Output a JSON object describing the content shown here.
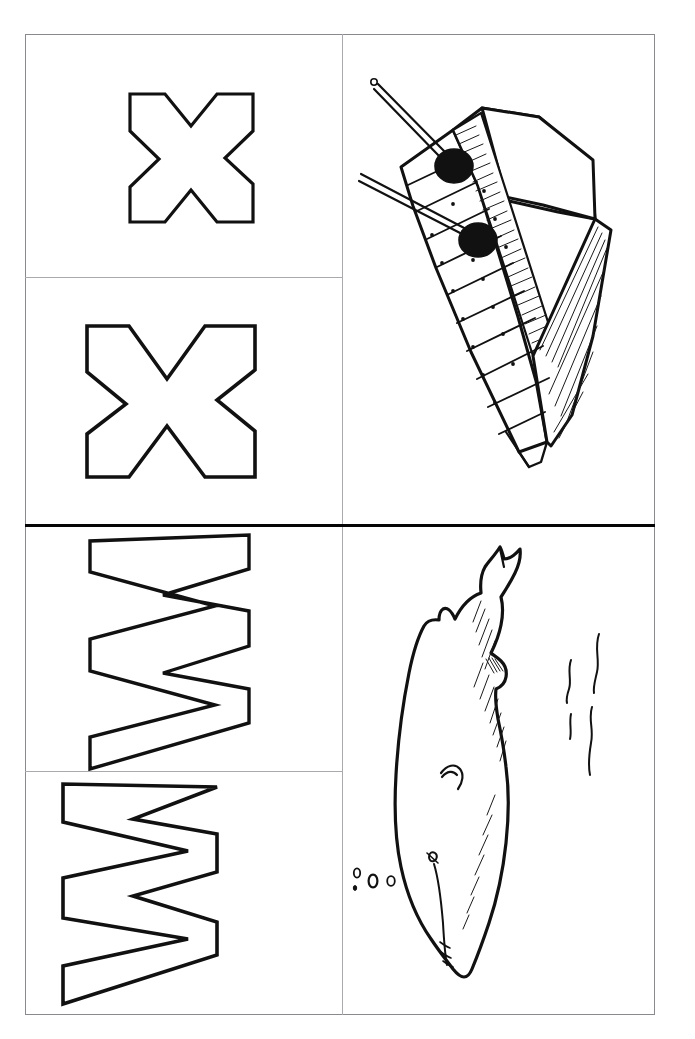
{
  "worksheet": {
    "title": "Alphabet Tracing Worksheet - X and W",
    "orientation": "portrait",
    "page_bg": "#ffffff",
    "ink_color": "#111111",
    "frame_color": "#8a8a8e",
    "divider_major_color": "#050505",
    "divider_minor_color": "#a9a9ae"
  },
  "cells": {
    "letter_x_top": {
      "name": "letter-x-outline-top",
      "letter": "X",
      "case": "uppercase",
      "style": "hollow-outline",
      "rotation_deg": 0,
      "description": "Outline of letter X for tracing"
    },
    "letter_x_bottom": {
      "name": "letter-x-outline-bottom",
      "letter": "X",
      "case": "uppercase",
      "style": "hollow-outline",
      "rotation_deg": 0,
      "description": "Outline of letter X for tracing"
    },
    "letter_w_top": {
      "name": "letter-w-outline-top",
      "letter": "W",
      "case": "uppercase",
      "style": "hollow-outline",
      "rotation_deg": 90,
      "description": "Outline of letter W rotated ninety degrees"
    },
    "letter_w_bottom": {
      "name": "letter-w-outline-bottom",
      "letter": "W",
      "case": "uppercase",
      "style": "hollow-outline",
      "rotation_deg": 90,
      "description": "Outline of letter W rotated ninety degrees"
    },
    "picture_xylophone": {
      "name": "xylophone-illustration",
      "subject": "xylophone",
      "initial_letter": "X",
      "style": "black-and-white line drawing",
      "elements": [
        "xylophone body",
        "wooden bars",
        "two mallets",
        "mallet heads"
      ],
      "mallet_count": 2,
      "bar_count": 9
    },
    "picture_whale": {
      "name": "whale-illustration",
      "subject": "whale",
      "initial_letter": "W",
      "style": "black-and-white line drawing",
      "elements": [
        "whale body",
        "tail fluke",
        "eye",
        "flipper",
        "throat pleats",
        "bubbles",
        "water ripples"
      ],
      "bubble_count": 4,
      "ripple_count": 3
    }
  },
  "icons": {
    "letter_x": "letter-x-icon",
    "letter_w": "letter-w-icon",
    "xylophone": "xylophone-icon",
    "whale": "whale-icon"
  }
}
